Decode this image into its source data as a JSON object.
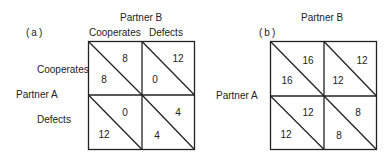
{
  "panels": [
    {
      "id": "a",
      "label": "(a)",
      "column_header": "Partner B",
      "row_header": "Partner A",
      "columns": [
        "Cooperates",
        "Defects"
      ],
      "rows": [
        "Cooperates",
        "Defects"
      ],
      "payoffs": [
        [
          {
            "a": "8",
            "b": "8"
          },
          {
            "a": "0",
            "b": "12"
          }
        ],
        [
          {
            "a": "12",
            "b": "0"
          },
          {
            "a": "4",
            "b": "4"
          }
        ]
      ]
    },
    {
      "id": "b",
      "label": "(b)",
      "column_header": "Partner B",
      "row_header": "Partner A",
      "columns": [],
      "rows": [],
      "payoffs": [
        [
          {
            "a": "16",
            "b": "16"
          },
          {
            "a": "12",
            "b": "12"
          }
        ],
        [
          {
            "a": "12",
            "b": "12"
          },
          {
            "a": "8",
            "b": "8"
          }
        ]
      ]
    }
  ]
}
